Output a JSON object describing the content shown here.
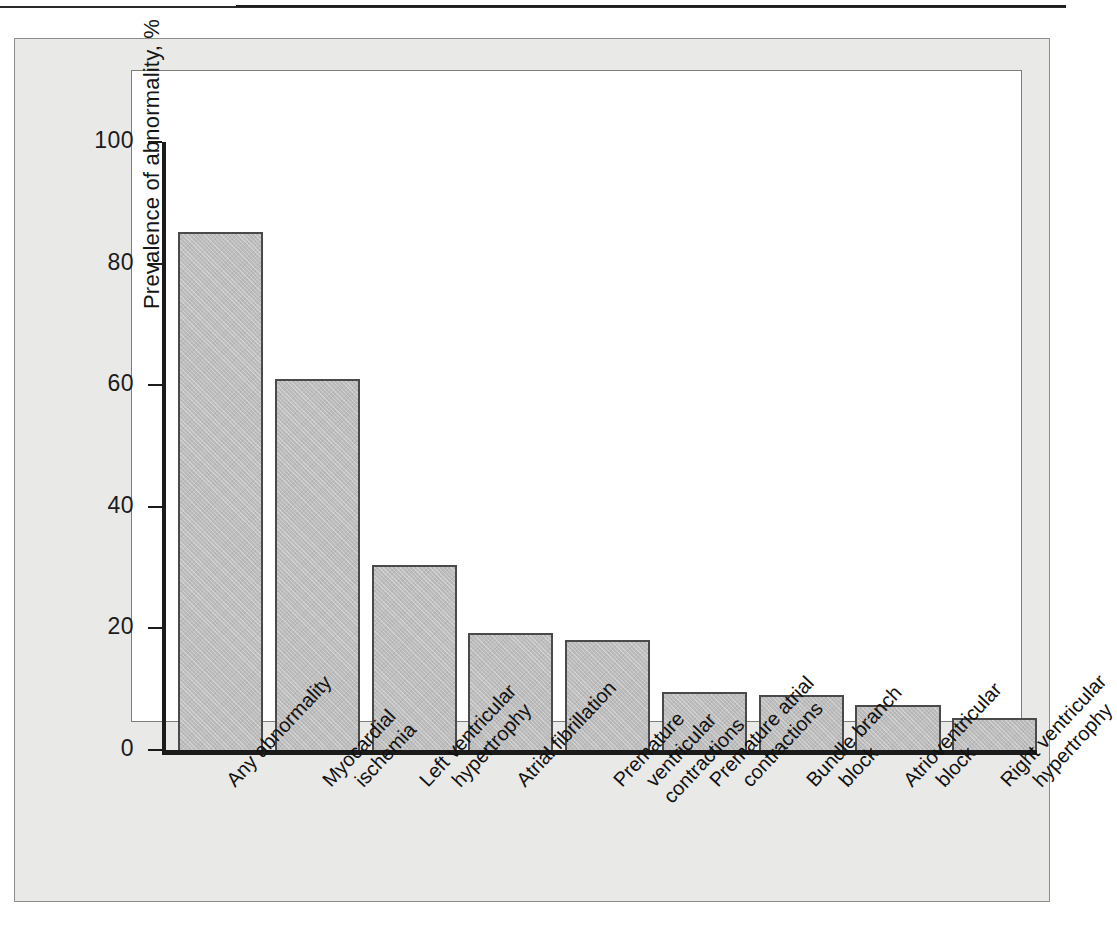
{
  "figure": {
    "background_color": "#e9e9e7",
    "plot_background_color": "#ffffff",
    "bar_fill_color": "#bdbdbd",
    "bar_border_color": "#4a4a4a",
    "axis_color": "#1b1b1b"
  },
  "chart_data": {
    "type": "bar",
    "title": "",
    "xlabel": "",
    "ylabel": "Prevalence of abnormality, %",
    "ylim": [
      0,
      100
    ],
    "yticks": [
      "0",
      "20",
      "40",
      "60",
      "80",
      "100"
    ],
    "grid": false,
    "legend": null,
    "categories": [
      "Any abnormality",
      "Myocardial ischemia",
      "Left ventricular hypertrophy",
      "Atrial fibrillation",
      "Premature ventricular contractions",
      "Premature atrial contractions",
      "Bundle branch block",
      "Atrioventricular block",
      "Right ventricular hypertrophy"
    ],
    "category_lines": [
      [
        "Any abnormality",
        ""
      ],
      [
        "Myocardial",
        "ischemia"
      ],
      [
        "Left ventricular",
        "hypertrophy"
      ],
      [
        "Atrial fibrillation",
        ""
      ],
      [
        "Premature",
        "ventricular",
        "contractions"
      ],
      [
        "Premature atrial",
        "contractions"
      ],
      [
        "Bundle branch",
        "block"
      ],
      [
        "Atrioventricular",
        "block"
      ],
      [
        "Right ventricular",
        "hypertrophy"
      ]
    ],
    "values": [
      85.2,
      61.0,
      30.4,
      19.3,
      18.1,
      9.6,
      9.1,
      7.4,
      5.2
    ]
  }
}
